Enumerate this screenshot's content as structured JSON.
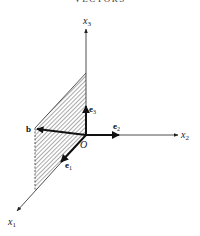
{
  "header": {
    "running_title": "VECTORS"
  },
  "figure": {
    "axes": [
      {
        "name": "x1",
        "label": "x",
        "sub": "1"
      },
      {
        "name": "x2",
        "label": "x",
        "sub": "2"
      },
      {
        "name": "x3",
        "label": "x",
        "sub": "3"
      }
    ],
    "origin_label": "O",
    "vectors": [
      {
        "name": "e1",
        "label": "e",
        "sub": "1"
      },
      {
        "name": "e2",
        "label": "e",
        "sub": "2"
      },
      {
        "name": "e3",
        "label": "e",
        "sub": "3"
      },
      {
        "name": "b",
        "label": "b"
      }
    ],
    "shaded_region": "plane spanned by e1 and e3 (x1-x3 plane)",
    "colors": {
      "ink": "#222222",
      "hatch": "#555555",
      "background": "#ffffff"
    }
  }
}
